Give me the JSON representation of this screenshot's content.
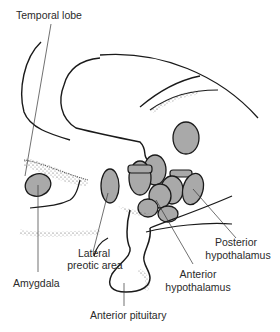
{
  "diagram": {
    "type": "anatomical-sagittal-section",
    "colors": {
      "outline": "#1a1a1a",
      "nucleus_fill": "#a9a9a9",
      "stipple": "#555555",
      "background": "#ffffff",
      "text": "#2a2a2a"
    },
    "labels": {
      "temporal_lobe": "Temporal lobe",
      "amygdala": "Amygdala",
      "lateral_preoptic_line1": "Lateral",
      "lateral_preoptic_line2": "preotic area",
      "anterior_pituitary": "Anterior pituitary",
      "anterior_hypothalamus_line1": "Anterior",
      "anterior_hypothalamus_line2": "hypothalamus",
      "posterior_hypothalamus_line1": "Posterior",
      "posterior_hypothalamus_line2": "hypothalamus"
    }
  }
}
